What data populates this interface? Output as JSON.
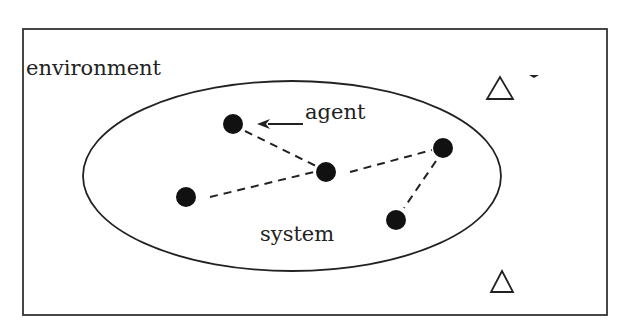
{
  "diagram": {
    "labels": {
      "environment": "environment",
      "agent": "agent",
      "system": "system"
    },
    "frame": {
      "x": 23,
      "y": 29,
      "width": 584,
      "height": 286
    },
    "system_ellipse": {
      "cx": 292,
      "cy": 176,
      "rx": 209,
      "ry": 95
    },
    "agents": [
      {
        "id": "a1",
        "x": 233,
        "y": 124
      },
      {
        "id": "a2",
        "x": 326,
        "y": 172
      },
      {
        "id": "a3",
        "x": 186,
        "y": 197
      },
      {
        "id": "a4",
        "x": 443,
        "y": 148
      },
      {
        "id": "a5",
        "x": 396,
        "y": 220
      }
    ],
    "links": [
      [
        "a1",
        "a2"
      ],
      [
        "a3",
        "a2"
      ],
      [
        "a2",
        "a4"
      ],
      [
        "a4",
        "a5"
      ]
    ],
    "environment_markers": [
      {
        "symbol": "triangle",
        "x": 500,
        "y": 88,
        "with_small_arrowhead": true
      },
      {
        "symbol": "triangle",
        "x": 502,
        "y": 282,
        "with_small_arrowhead": false
      }
    ],
    "colors": {
      "stroke": "#222222",
      "fill_node": "#111111",
      "background": "#ffffff"
    }
  }
}
